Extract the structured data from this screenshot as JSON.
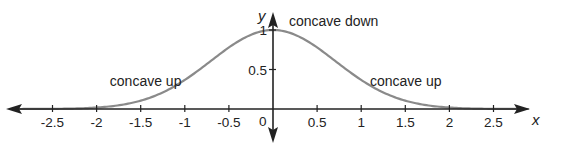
{
  "chart_data": {
    "type": "line",
    "title": "",
    "xlabel": "x",
    "ylabel": "y",
    "xlim": [
      -2.9,
      2.9
    ],
    "ylim": [
      -0.35,
      1.15
    ],
    "grid": false,
    "function": "y = e^(-x^2)",
    "x_ticks": [
      -2.5,
      -2,
      -1.5,
      -1,
      -0.5,
      0.5,
      1,
      1.5,
      2,
      2.5
    ],
    "x_tick_labels": [
      "-2.5",
      "-2",
      "-1.5",
      "-1",
      "-0.5",
      "0.5",
      "1",
      "1.5",
      "2",
      "2.5"
    ],
    "y_ticks": [
      0.5,
      1
    ],
    "y_tick_labels": [
      "0.5",
      "1"
    ],
    "origin_label": "0",
    "series": [
      {
        "name": "curve",
        "color": "#8a8a8a",
        "x": [
          -2.9,
          -2.5,
          -2,
          -1.5,
          -1,
          -0.5,
          0,
          0.5,
          1,
          1.5,
          2,
          2.5,
          2.9
        ],
        "y": [
          0.0002,
          0.0019,
          0.0183,
          0.1054,
          0.3679,
          0.7788,
          1.0,
          0.7788,
          0.3679,
          0.1054,
          0.0183,
          0.0019,
          0.0002
        ]
      }
    ],
    "annotations": [
      {
        "text": "concave up",
        "x": -1.85,
        "y": 0.36
      },
      {
        "text": "concave down",
        "x": 0.18,
        "y": 1.12
      },
      {
        "text": "concave up",
        "x": 1.1,
        "y": 0.36
      }
    ],
    "colors": {
      "axis": "#222222",
      "curve": "#8a8a8a",
      "text": "#222222"
    }
  },
  "layout": {
    "origin_px": [
      273,
      109
    ],
    "x_px_per_unit": 88.2,
    "y_px_per_unit": 79
  }
}
